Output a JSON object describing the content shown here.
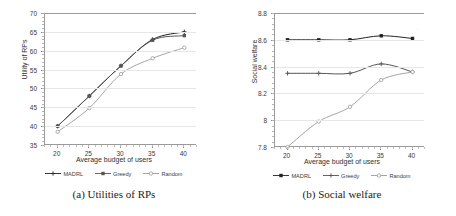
{
  "figure": {
    "panels": [
      {
        "id": "panel-a",
        "caption": "(a) Utilities of RPs",
        "xlabel": "Average budget of users",
        "ylabel": "Utility of RPs",
        "xticks": [
          "20",
          "25",
          "30",
          "35",
          "40"
        ],
        "yticks": [
          "70",
          "65",
          "60",
          "55",
          "50",
          "45",
          "40",
          "35"
        ],
        "legend": [
          {
            "label": "MADRL",
            "color": "#222222",
            "marker": "cross"
          },
          {
            "label": "Greedy",
            "color": "#555555",
            "marker": "square"
          },
          {
            "label": "Random",
            "color": "#9a9a9a",
            "marker": "circle"
          }
        ]
      },
      {
        "id": "panel-b",
        "caption": "(b) Social welfare",
        "xlabel": "Average budget of users",
        "ylabel": "Social welfare",
        "xticks": [
          "20",
          "25",
          "30",
          "35",
          "40"
        ],
        "yticks": [
          "8.8",
          "8.6",
          "8.4",
          "8.2",
          "8",
          "7.8"
        ],
        "legend": [
          {
            "label": "MADRL",
            "color": "#222222",
            "marker": "square"
          },
          {
            "label": "Greedy",
            "color": "#555555",
            "marker": "cross"
          },
          {
            "label": "Random",
            "color": "#9a9a9a",
            "marker": "circle"
          }
        ]
      }
    ]
  },
  "chart_data": [
    {
      "type": "line",
      "title": "(a) Utilities of RPs",
      "xlabel": "Average budget of users",
      "ylabel": "Utility of RPs",
      "x": [
        20,
        25,
        30,
        35,
        40
      ],
      "xlim": [
        18,
        42
      ],
      "ylim": [
        35,
        70
      ],
      "yticks": [
        35,
        40,
        45,
        50,
        55,
        60,
        65,
        70
      ],
      "grid": true,
      "legend_position": "below",
      "series": [
        {
          "name": "MADRL",
          "values": [
            40.0,
            48.0,
            56.0,
            63.0,
            65.0
          ]
        },
        {
          "name": "Greedy",
          "values": [
            40.0,
            48.0,
            56.0,
            62.8,
            64.0
          ]
        },
        {
          "name": "Random",
          "values": [
            38.5,
            44.8,
            53.8,
            58.0,
            60.8
          ]
        }
      ]
    },
    {
      "type": "line",
      "title": "(b) Social welfare",
      "xlabel": "Average budget of users",
      "ylabel": "Social welfare",
      "x": [
        20,
        25,
        30,
        35,
        40
      ],
      "xlim": [
        18,
        42
      ],
      "ylim": [
        7.8,
        8.8
      ],
      "yticks": [
        7.8,
        8.0,
        8.2,
        8.4,
        8.6,
        8.8
      ],
      "grid": true,
      "legend_position": "below",
      "series": [
        {
          "name": "MADRL",
          "values": [
            8.6,
            8.6,
            8.6,
            8.63,
            8.61
          ]
        },
        {
          "name": "Greedy",
          "values": [
            8.35,
            8.35,
            8.35,
            8.42,
            8.36
          ]
        },
        {
          "name": "Random",
          "values": [
            7.8,
            7.99,
            8.1,
            8.3,
            8.36
          ]
        }
      ]
    }
  ]
}
